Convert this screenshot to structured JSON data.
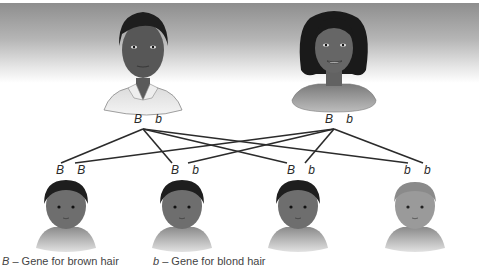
{
  "parents": [
    {
      "role": "father",
      "genotype": "B  b",
      "alleles": [
        "B",
        "b"
      ]
    },
    {
      "role": "mother",
      "genotype": "B  b",
      "alleles": [
        "B",
        "b"
      ]
    }
  ],
  "children": [
    {
      "genotype": "B  B",
      "alleles": [
        "B",
        "B"
      ],
      "hair": "dark"
    },
    {
      "genotype": "B  b",
      "alleles": [
        "B",
        "b"
      ],
      "hair": "dark"
    },
    {
      "genotype": "B  b",
      "alleles": [
        "B",
        "b"
      ],
      "hair": "dark"
    },
    {
      "genotype": "b  b",
      "alleles": [
        "b",
        "b"
      ],
      "hair": "blond"
    }
  ],
  "legend": {
    "B_symbol": "B",
    "B_text": " – Gene for brown hair",
    "b_symbol": "b",
    "b_text": " – Gene for blond hair"
  },
  "colors": {
    "line": "#2b2b2b",
    "skin_dark": "#6a6a6a",
    "skin_light": "#9a9a9a",
    "hair_dark": "#1e1e1e",
    "hair_blond": "#8c8c8c"
  }
}
